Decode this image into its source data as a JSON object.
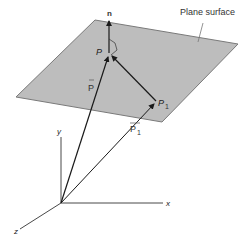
{
  "diagram": {
    "title_label": "Plane surface",
    "colors": {
      "plane_fill": "#bdbdbd",
      "plane_edge": "#7a7a7a",
      "line": "#1a1a1a",
      "text": "#333333"
    },
    "labels": {
      "normal": "n",
      "point_p": "P",
      "point_p1": "P",
      "point_p1_sub": "1",
      "vector_p": "P",
      "vector_p1": "P",
      "vector_p1_sub": "1",
      "axis_x": "x",
      "axis_y": "y",
      "axis_z": "z"
    },
    "points": {
      "origin": [
        61,
        203
      ],
      "P": [
        109,
        53
      ],
      "P1": [
        156,
        101
      ],
      "n_tip": [
        109,
        20
      ]
    },
    "plane_corners": [
      [
        95,
        20
      ],
      [
        238,
        44
      ],
      [
        162,
        122
      ],
      [
        16,
        97
      ]
    ],
    "axes": {
      "x_end": [
        163,
        203
      ],
      "y_end": [
        61,
        137
      ],
      "z_end": [
        20,
        229
      ]
    }
  }
}
